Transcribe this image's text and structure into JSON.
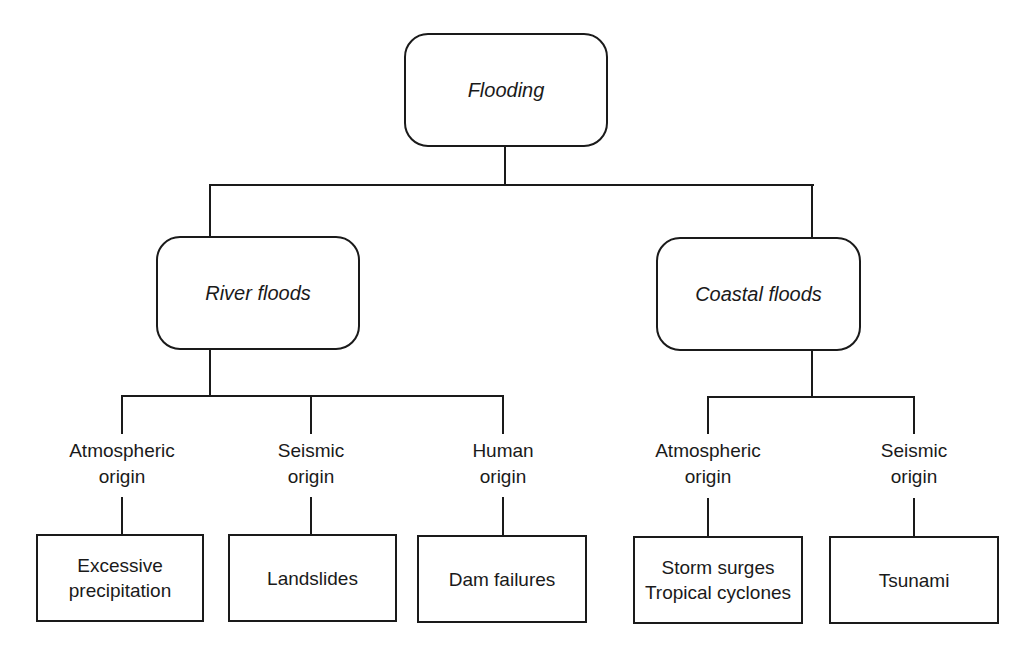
{
  "diagram": {
    "root": {
      "label": "Flooding"
    },
    "branches": [
      {
        "label": "River floods",
        "origins": [
          {
            "label": "Atmospheric\norigin",
            "effect": "Excessive\nprecipitation"
          },
          {
            "label": "Seismic\norigin",
            "effect": "Landslides"
          },
          {
            "label": "Human\norigin",
            "effect": "Dam failures"
          }
        ]
      },
      {
        "label": "Coastal floods",
        "origins": [
          {
            "label": "Atmospheric\norigin",
            "effect": "Storm surges\nTropical cyclones"
          },
          {
            "label": "Seismic\norigin",
            "effect": "Tsunami"
          }
        ]
      }
    ],
    "colors": {
      "line": "#1a1a1a",
      "background": "#ffffff"
    }
  }
}
